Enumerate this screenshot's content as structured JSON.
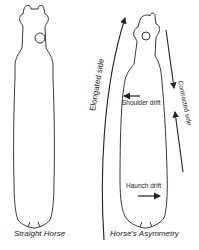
{
  "diagram": {
    "figures": [
      {
        "id": "straight",
        "caption": "Straight Horse"
      },
      {
        "id": "asymmetry",
        "caption": "Horse's Asymmetry"
      }
    ],
    "labels": {
      "elongated_side": "Elongated side",
      "contracted_side": "Contracted side",
      "shoulder_drift": "Shoulder drift",
      "haunch_drift": "Haunch drift"
    },
    "colors": {
      "line": "#222222",
      "background": "#ffffff"
    }
  }
}
